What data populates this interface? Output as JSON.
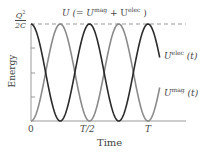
{
  "chart_data": {
    "type": "line",
    "xlabel": "Time",
    "ylabel": "Energy",
    "x_ticks": [
      "0",
      "T/2",
      "T"
    ],
    "y_top_label": "Q^2/2C",
    "xlim": [
      0,
      1.1
    ],
    "ylim": [
      0,
      1
    ],
    "grid": false,
    "series": [
      {
        "name": "U^elec(t)",
        "color": "#2a2a2a",
        "formula": "cos^2(2*pi*t/T)",
        "x": [
          0,
          0.125,
          0.25,
          0.375,
          0.5,
          0.625,
          0.75,
          0.875,
          1.0
        ],
        "values": [
          1,
          0.5,
          0,
          0.5,
          1,
          0.5,
          0,
          0.5,
          1
        ]
      },
      {
        "name": "U^mag(t)",
        "color": "#8a8a8a",
        "formula": "sin^2(2*pi*t/T)",
        "x": [
          0,
          0.125,
          0.25,
          0.375,
          0.5,
          0.625,
          0.75,
          0.875,
          1.0
        ],
        "values": [
          0,
          0.5,
          1,
          0.5,
          0,
          0.5,
          1,
          0.5,
          0
        ]
      },
      {
        "name": "U (total)",
        "color": "#999999",
        "style": "dashed",
        "values": [
          1,
          1
        ]
      }
    ]
  },
  "labels": {
    "total": "U (= U",
    "total_mag": "mag",
    "total_plus": " + U",
    "total_elec": "elec",
    "total_close": " )",
    "q2": "Q",
    "q2_exp": "2",
    "two_c": "2C",
    "energy": "Energy",
    "time": "Time",
    "x0": "0",
    "xhalf": "T/2",
    "xT": "T",
    "elec_U": "U",
    "elec_sup": "elec",
    "elec_t": " (t)",
    "mag_U": "U",
    "mag_sup": "mag",
    "mag_t": " (t)"
  }
}
